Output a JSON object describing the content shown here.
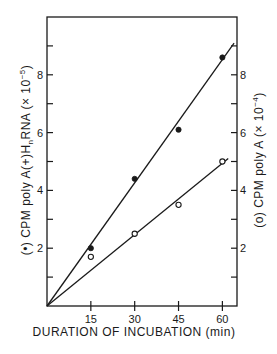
{
  "chart_data": {
    "type": "scatter",
    "title": "",
    "xlabel": "DURATION OF INCUBATION (min)",
    "ylabel": "(•) CPM poly A(+)HnRNA (× 10^-5)",
    "ylabel_right": "(o) CPM poly A (× 10^-4)",
    "xlim": [
      0,
      65
    ],
    "ylim": [
      0,
      10
    ],
    "ylim_right": [
      0,
      10
    ],
    "x_ticks": [
      15,
      30,
      45,
      60
    ],
    "y_ticks_labeled": [
      2,
      4,
      6,
      8
    ],
    "y_ticks_minor": [
      1,
      3,
      5,
      7,
      9
    ],
    "grid": false,
    "legend": "inline in axis labels",
    "series": [
      {
        "name": "CPM poly A(+)HnRNA (x10^-5)",
        "marker": "filled-circle",
        "axis": "left",
        "x": [
          15,
          30,
          45,
          60
        ],
        "values": [
          2.0,
          4.4,
          6.1,
          8.6
        ],
        "fit_line": {
          "x": [
            0,
            64
          ],
          "y": [
            0,
            9.1
          ]
        }
      },
      {
        "name": "CPM poly A (x10^-4)",
        "marker": "open-circle",
        "axis": "right",
        "x": [
          15,
          30,
          45,
          60
        ],
        "values": [
          1.7,
          2.5,
          3.5,
          5.0
        ],
        "fit_line": {
          "x": [
            0,
            62
          ],
          "y": [
            0,
            5.1
          ]
        }
      }
    ]
  },
  "labels": {
    "x_title": "DURATION OF INCUBATION (min)",
    "left_title_prefix": "(•) CPM poly A(+)H",
    "left_title_sub": "n",
    "left_title_suffix": "RNA (× 10",
    "left_title_exp": "−5",
    "left_title_close": ")",
    "right_title_prefix": "(o) CPM poly A (× 10",
    "right_title_exp": "−4",
    "right_title_close": ")",
    "x_tick_labels": [
      "15",
      "30",
      "45",
      "60"
    ],
    "y_tick_labels": [
      "2",
      "4",
      "6",
      "8"
    ]
  }
}
